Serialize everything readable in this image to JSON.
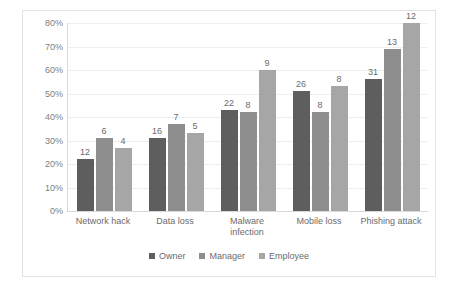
{
  "chart_data": {
    "type": "bar",
    "title": "",
    "subtitle": "",
    "xlabel": "",
    "ylabel": "",
    "ylim": [
      0,
      80
    ],
    "ytick_labels": [
      "0%",
      "10%",
      "20%",
      "30%",
      "40%",
      "50%",
      "60%",
      "70%",
      "80%"
    ],
    "ytick_values": [
      0,
      10,
      20,
      30,
      40,
      50,
      60,
      70,
      80
    ],
    "grid": true,
    "legend_position": "bottom",
    "categories": [
      "Network hack",
      "Data loss",
      "Malware infection",
      "Mobile loss",
      "Phishing attack"
    ],
    "category_lines": [
      [
        "Network hack"
      ],
      [
        "Data loss"
      ],
      [
        "Malware",
        "infection"
      ],
      [
        "Mobile loss"
      ],
      [
        "Phishing attack"
      ]
    ],
    "series": [
      {
        "name": "Owner",
        "color": "#5e5e5e",
        "values": [
          22,
          31,
          43,
          51,
          56
        ],
        "data_labels": [
          "12",
          "16",
          "22",
          "26",
          "31"
        ]
      },
      {
        "name": "Manager",
        "color": "#8e8e8e",
        "values": [
          31,
          37,
          42,
          42,
          69
        ],
        "data_labels": [
          "6",
          "7",
          "8",
          "8",
          "13"
        ]
      },
      {
        "name": "Employee",
        "color": "#a6a6a6",
        "values": [
          27,
          33,
          60,
          53,
          80
        ],
        "data_labels": [
          "4",
          "5",
          "9",
          "8",
          "12"
        ]
      }
    ]
  },
  "legend": {
    "items": [
      {
        "label": "Owner",
        "key": "owner"
      },
      {
        "label": "Manager",
        "key": "manager"
      },
      {
        "label": "Employee",
        "key": "employee"
      }
    ]
  }
}
